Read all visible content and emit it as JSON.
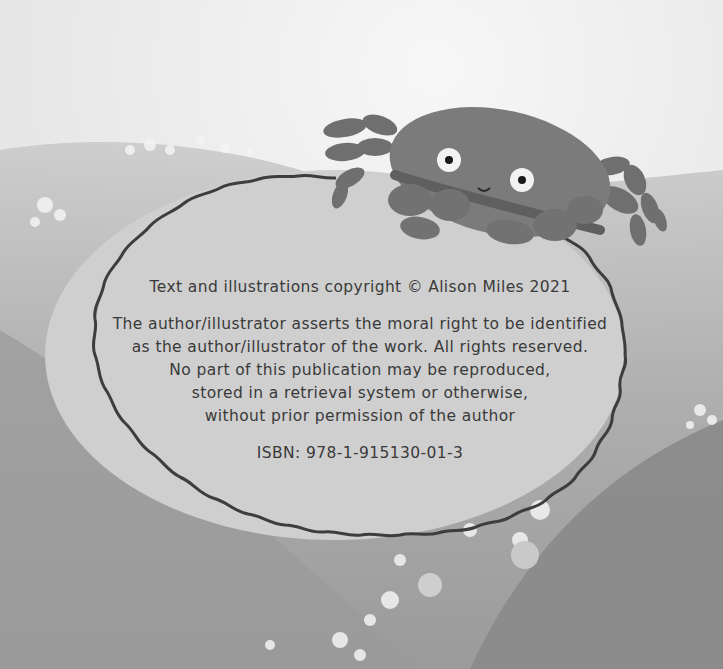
{
  "page": {
    "type": "copyright-page",
    "illustration": "crab-on-wave",
    "colors": {
      "label_fill": "#cfcfcf",
      "label_border": "#3d3d3d",
      "text": "#3a3a3a",
      "crab": "#7a7a7a",
      "wave_dark": "#8c8c8c",
      "sky": "#f2f2f2"
    }
  },
  "copyright": {
    "line": "Text and illustrations copyright © Alison Miles 2021"
  },
  "rights": {
    "lines": [
      "The author/illustrator asserts the moral right to be identified",
      "as the author/illustrator of the work. All rights reserved.",
      "No part of this publication may be reproduced,",
      "stored in a retrieval system or otherwise,",
      "without prior permission of the author"
    ]
  },
  "isbn": {
    "text": "ISBN: 978-1-915130-01-3"
  }
}
